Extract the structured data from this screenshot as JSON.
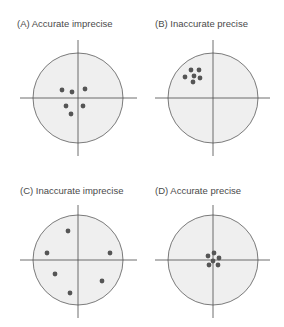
{
  "colors": {
    "target_fill": "#efefef",
    "target_stroke": "#5a5a5a",
    "axis_stroke": "#4a4a4a",
    "dot_fill": "#555555",
    "label_text": "#4a4a4a"
  },
  "panels": [
    {
      "id": "A",
      "label": "(A)  Accurate imprecise",
      "accuracy": "accurate",
      "precision": "imprecise",
      "label_pos": [
        17,
        19
      ],
      "center": [
        78,
        98
      ],
      "radius": 45,
      "vline": [
        40,
        156
      ],
      "hline": [
        20,
        137
      ],
      "dots": [
        [
          62,
          90
        ],
        [
          72,
          92
        ],
        [
          85,
          89
        ],
        [
          66,
          106
        ],
        [
          83,
          106
        ],
        [
          71,
          114
        ]
      ]
    },
    {
      "id": "B",
      "label": "(B)  Inaccurate precise",
      "accuracy": "inaccurate",
      "precision": "precise",
      "label_pos": [
        155,
        19
      ],
      "center": [
        213,
        98
      ],
      "radius": 45,
      "vline": [
        40,
        156
      ],
      "hline": [
        155,
        270
      ],
      "dots": [
        [
          191,
          70
        ],
        [
          199,
          70
        ],
        [
          185,
          77
        ],
        [
          194,
          76
        ],
        [
          200,
          78
        ],
        [
          193,
          82
        ]
      ]
    },
    {
      "id": "C",
      "label": "(C)  Inaccurate imprecise",
      "accuracy": "inaccurate",
      "precision": "imprecise",
      "label_pos": [
        20,
        186
      ],
      "center": [
        78,
        260
      ],
      "radius": 45,
      "vline": [
        205,
        318
      ],
      "hline": [
        20,
        137
      ],
      "dots": [
        [
          68,
          231
        ],
        [
          47,
          253
        ],
        [
          110,
          253
        ],
        [
          55,
          274
        ],
        [
          102,
          281
        ],
        [
          70,
          293
        ]
      ]
    },
    {
      "id": "D",
      "label": "(D)  Accurate precise",
      "accuracy": "accurate",
      "precision": "precise",
      "label_pos": [
        155,
        186
      ],
      "center": [
        213,
        260
      ],
      "radius": 45,
      "vline": [
        205,
        318
      ],
      "hline": [
        155,
        270
      ],
      "dots": [
        [
          214,
          253
        ],
        [
          208,
          256
        ],
        [
          219,
          258
        ],
        [
          213,
          261
        ],
        [
          209,
          265
        ],
        [
          218,
          265
        ]
      ]
    }
  ]
}
